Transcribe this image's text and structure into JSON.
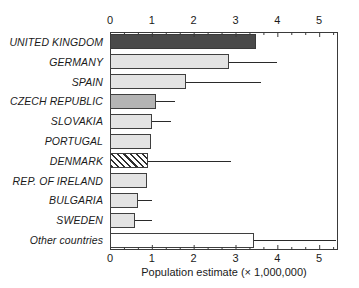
{
  "chart_data": {
    "type": "bar",
    "orientation": "horizontal",
    "title": "",
    "xlabel": "Population estimate (× 1,000,000)",
    "ylabel": "",
    "xlim": [
      0,
      5.45
    ],
    "xticks": [
      0,
      1,
      2,
      3,
      4,
      5
    ],
    "xtick_labels": [
      "0",
      "1",
      "2",
      "3",
      "4",
      "5"
    ],
    "minor_ticks_per_interval": 2,
    "grid": false,
    "legend": "none",
    "axis_positions": [
      "top",
      "bottom"
    ],
    "categories": [
      "UNITED KINGDOM",
      "GERMANY",
      "SPAIN",
      "CZECH REPUBLIC",
      "SLOVAKIA",
      "PORTUGAL",
      "DENMARK",
      "REP. OF IRELAND",
      "BULGARIA",
      "SWEDEN",
      "Other countries"
    ],
    "values": [
      3.5,
      2.85,
      1.82,
      1.1,
      1.0,
      0.98,
      0.92,
      0.88,
      0.67,
      0.6,
      3.45
    ],
    "error_low": [
      null,
      2.0,
      1.0,
      0.8,
      0.7,
      null,
      0.0,
      null,
      0.5,
      0.45,
      2.45
    ],
    "error_high": [
      null,
      4.0,
      3.6,
      1.55,
      1.45,
      null,
      2.9,
      null,
      1.0,
      1.0,
      5.4
    ],
    "fills": [
      "dark-gray",
      "light-gray",
      "light-gray",
      "medium-gray",
      "light-gray",
      "light-gray",
      "diagonal-hatch",
      "light-gray",
      "light-gray",
      "light-gray",
      "white"
    ],
    "series": [
      {
        "name": "Population estimate",
        "values": [
          3.5,
          2.85,
          1.82,
          1.1,
          1.0,
          0.98,
          0.92,
          0.88,
          0.67,
          0.6,
          3.45
        ]
      }
    ]
  },
  "colors": {
    "dark-gray": "#4a4a4a",
    "medium-gray": "#b4b4b4",
    "light-gray": "#e3e3e3",
    "white": "#ffffff",
    "axis": "#3a3a3a",
    "error": "#2a2a2a",
    "text": "#1a1a1a",
    "background": "#ffffff"
  }
}
